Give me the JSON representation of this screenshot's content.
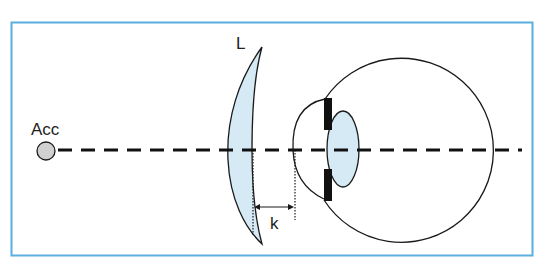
{
  "diagram": {
    "labels": {
      "accommodation": "Acc",
      "lens": "L",
      "distance": "k"
    },
    "colors": {
      "frame": "#5aaee0",
      "lens_fill": "#d6eaf6",
      "stroke": "#1a1a1a",
      "point_fill": "#d0d0d0"
    }
  }
}
